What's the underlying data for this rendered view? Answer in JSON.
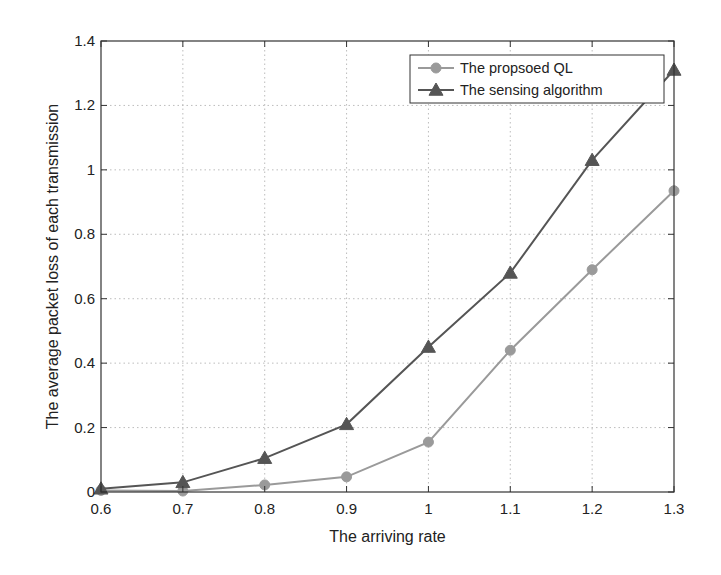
{
  "chart_data": {
    "type": "line",
    "title": "",
    "xlabel": "The arriving rate",
    "ylabel": "The average packet loss of each transmission",
    "x": [
      0.6,
      0.7,
      0.8,
      0.9,
      1.0,
      1.1,
      1.2,
      1.3
    ],
    "xlim": [
      0.6,
      1.3
    ],
    "ylim": [
      0,
      1.4
    ],
    "xticks": [
      "0.6",
      "0.7",
      "0.8",
      "0.9",
      "1",
      "1.1",
      "1.2",
      "1.3"
    ],
    "yticks": [
      "0",
      "0.2",
      "0.4",
      "0.6",
      "0.8",
      "1",
      "1.2",
      "1.4"
    ],
    "grid": true,
    "legend_position": "upper right",
    "series": [
      {
        "name": "The propsoed QL",
        "marker": "circle",
        "color": "#9a9a9a",
        "values": [
          0.005,
          0.003,
          0.022,
          0.047,
          0.155,
          0.44,
          0.69,
          0.935
        ]
      },
      {
        "name": "The sensing algorithm",
        "marker": "triangle",
        "color": "#555555",
        "values": [
          0.01,
          0.03,
          0.105,
          0.21,
          0.45,
          0.68,
          1.03,
          1.31
        ]
      }
    ]
  }
}
